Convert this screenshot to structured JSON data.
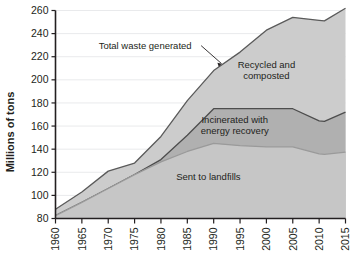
{
  "chart_data": {
    "type": "area",
    "stacked": true,
    "title": "",
    "xlabel": "",
    "ylabel": "Millions of tons",
    "xlim": [
      1960,
      2015
    ],
    "ylim": [
      80,
      260
    ],
    "ytick_step": 20,
    "xtick_step": 5,
    "grid": true,
    "legend_position": "inline-annotations",
    "x": [
      1960,
      1965,
      1970,
      1975,
      1980,
      1985,
      1990,
      1995,
      2000,
      2005,
      2010,
      2011,
      2015
    ],
    "xtick_labels": [
      "1960",
      "1965",
      "1970",
      "1975",
      "1980",
      "1985",
      "1990",
      "1995",
      "2000",
      "2005",
      "2010",
      "2015"
    ],
    "ytick_labels": [
      "80",
      "100",
      "120",
      "140",
      "160",
      "180",
      "200",
      "220",
      "240",
      "260"
    ],
    "series": [
      {
        "name": "Sent to landfills",
        "label": "Sent to landfills",
        "color": "#c6c6c6",
        "stroke": "#9a9a9a",
        "values": [
          82.5,
          94,
          106,
          118,
          129,
          138,
          145,
          143,
          142,
          142,
          136,
          135.5,
          137.5
        ],
        "label_x": 1989,
        "label_y": 113
      },
      {
        "name": "Incinerated with energy recovery",
        "label_line1": "Incinerated with",
        "label_line2": "energy recovery",
        "color": "#b0b0b0",
        "stroke": "#4d4d4d",
        "values": [
          82.5,
          94,
          106,
          118,
          131,
          152,
          175,
          175,
          175,
          175,
          164.5,
          164,
          172
        ],
        "label_x": 1994,
        "label_y": 163
      },
      {
        "name": "Recycled and composted",
        "label_line1": "Recycled and",
        "label_line2": "composted",
        "color": "#cccccc",
        "stroke": "#5a5a5a",
        "values": [
          88,
          103,
          121,
          128,
          151,
          182,
          208,
          224,
          243,
          254,
          251.5,
          251,
          262
        ],
        "label_x": 2000,
        "label_y": 210
      }
    ],
    "annotations": [
      {
        "name": "total-waste-generated",
        "text": "Total waste generated",
        "x": 1977,
        "y": 227,
        "pointer_to_x": 1991.5,
        "pointer_to_y": 214
      }
    ]
  }
}
